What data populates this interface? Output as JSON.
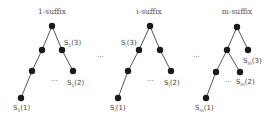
{
  "trees": [
    {
      "title": "1-suffix",
      "sub": "1",
      "labels": {
        "s3": "(3)",
        "s2": "(2)",
        "s1": "(1)"
      },
      "ellipsis": "···"
    },
    {
      "title": "i-suffix",
      "sub": "i",
      "labels": {
        "s3": "(3)",
        "s2": "(2)",
        "s1": "(1)"
      },
      "ellipsis": "···"
    },
    {
      "title": "m-suffix",
      "sub": "m",
      "labels": {
        "s3": "(3)",
        "s2": "(2)",
        "s1": "(1)"
      },
      "ellipsis": "···"
    }
  ],
  "between": {
    "ellipsis_1": "···",
    "ellipsis_2": "···"
  },
  "symbol": "S"
}
